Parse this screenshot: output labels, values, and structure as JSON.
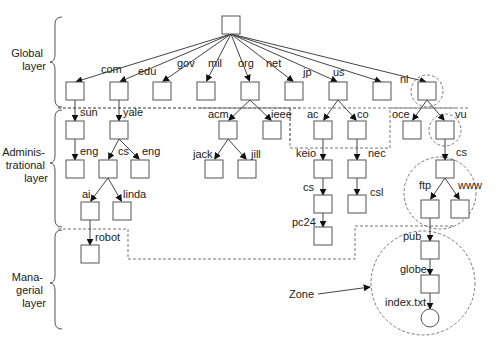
{
  "figure": {
    "type": "DNS name space partitioned into layers",
    "layers": [
      {
        "id": "global",
        "label_lines": [
          "Global",
          "layer"
        ]
      },
      {
        "id": "administrational",
        "label_lines": [
          "Adminis-",
          "trational",
          "layer"
        ]
      },
      {
        "id": "managerial",
        "label_lines": [
          "Mana-",
          "gerial",
          "layer"
        ]
      }
    ],
    "annotation": {
      "label": "Zone"
    },
    "nodes": [
      {
        "id": "root",
        "shape": "box",
        "x": 222,
        "y": 16
      },
      {
        "id": "com",
        "shape": "box",
        "x": 66,
        "y": 82,
        "label": "com",
        "parent": "root",
        "lx": 101,
        "ly": 73
      },
      {
        "id": "edu",
        "shape": "box",
        "x": 110,
        "y": 82,
        "label": "edu",
        "parent": "root",
        "lx": 138,
        "ly": 75
      },
      {
        "id": "gov",
        "shape": "box",
        "x": 153,
        "y": 82,
        "label": "gov",
        "parent": "root",
        "lx": 177,
        "ly": 67
      },
      {
        "id": "mil",
        "shape": "box",
        "x": 197,
        "y": 82,
        "label": "mil",
        "parent": "root",
        "lx": 208,
        "ly": 67
      },
      {
        "id": "org",
        "shape": "box",
        "x": 241,
        "y": 82,
        "label": "org",
        "parent": "root",
        "lx": 238,
        "ly": 67
      },
      {
        "id": "net",
        "shape": "box",
        "x": 285,
        "y": 82,
        "label": "net",
        "parent": "root",
        "lx": 266,
        "ly": 67
      },
      {
        "id": "jp",
        "shape": "box",
        "x": 329,
        "y": 82,
        "label": "jp",
        "parent": "root",
        "lx": 303,
        "ly": 76
      },
      {
        "id": "us",
        "shape": "box",
        "x": 373,
        "y": 82,
        "label": "us",
        "parent": "root",
        "lx": 333,
        "ly": 76
      },
      {
        "id": "nl",
        "shape": "box",
        "x": 418,
        "y": 82,
        "label": "nl",
        "parent": "root",
        "lx": 400,
        "ly": 83
      },
      {
        "id": "sun",
        "shape": "box",
        "x": 66,
        "y": 121,
        "label": "sun",
        "parent": "com",
        "lx": 80,
        "ly": 116
      },
      {
        "id": "yale",
        "shape": "box",
        "x": 110,
        "y": 121,
        "label": "yale",
        "parent": "edu",
        "lx": 123,
        "ly": 116
      },
      {
        "id": "acm",
        "shape": "box",
        "x": 219,
        "y": 121,
        "label": "acm",
        "parent": "org",
        "lx": 208,
        "ly": 118
      },
      {
        "id": "ieee",
        "shape": "box",
        "x": 263,
        "y": 121,
        "label": "ieee",
        "parent": "org",
        "lx": 271,
        "ly": 118
      },
      {
        "id": "ac",
        "shape": "box",
        "x": 314,
        "y": 121,
        "label": "ac",
        "parent": "jp",
        "lx": 307,
        "ly": 118
      },
      {
        "id": "co",
        "shape": "box",
        "x": 348,
        "y": 121,
        "label": "co",
        "parent": "jp",
        "lx": 357,
        "ly": 118
      },
      {
        "id": "oce",
        "shape": "box",
        "x": 403,
        "y": 121,
        "label": "oce",
        "parent": "nl",
        "lx": 392,
        "ly": 118
      },
      {
        "id": "vu",
        "shape": "box",
        "x": 436,
        "y": 121,
        "label": "vu",
        "parent": "nl",
        "lx": 455,
        "ly": 118
      },
      {
        "id": "eng1",
        "shape": "box",
        "x": 66,
        "y": 160,
        "label": "eng",
        "parent": "sun",
        "lx": 80,
        "ly": 155
      },
      {
        "id": "cs1",
        "shape": "box",
        "x": 99,
        "y": 160,
        "label": "cs",
        "parent": "yale",
        "lx": 118,
        "ly": 155
      },
      {
        "id": "eng2",
        "shape": "box",
        "x": 131,
        "y": 160,
        "label": "eng",
        "parent": "yale",
        "lx": 142,
        "ly": 155
      },
      {
        "id": "jack",
        "shape": "box",
        "x": 205,
        "y": 160,
        "label": "jack",
        "parent": "acm",
        "lx": 193,
        "ly": 158
      },
      {
        "id": "jill",
        "shape": "box",
        "x": 238,
        "y": 160,
        "label": "jill",
        "parent": "acm",
        "lx": 251,
        "ly": 158
      },
      {
        "id": "keio",
        "shape": "box",
        "x": 314,
        "y": 160,
        "label": "keio",
        "parent": "ac",
        "lx": 296,
        "ly": 157
      },
      {
        "id": "nec",
        "shape": "box",
        "x": 348,
        "y": 160,
        "label": "nec",
        "parent": "co",
        "lx": 368,
        "ly": 157
      },
      {
        "id": "cs3",
        "shape": "box",
        "x": 436,
        "y": 160,
        "label": "cs",
        "parent": "vu",
        "lx": 456,
        "ly": 156
      },
      {
        "id": "ai",
        "shape": "box",
        "x": 81,
        "y": 202,
        "label": "ai",
        "parent": "cs1",
        "lx": 82,
        "ly": 198
      },
      {
        "id": "linda",
        "shape": "box",
        "x": 113,
        "y": 202,
        "label": "linda",
        "parent": "cs1",
        "lx": 123,
        "ly": 198
      },
      {
        "id": "cs2",
        "shape": "box",
        "x": 314,
        "y": 195,
        "label": "cs",
        "parent": "keio",
        "lx": 303,
        "ly": 191
      },
      {
        "id": "csl",
        "shape": "box",
        "x": 348,
        "y": 195,
        "label": "csl",
        "parent": "nec",
        "lx": 370,
        "ly": 196
      },
      {
        "id": "ftp",
        "shape": "box",
        "x": 421,
        "y": 200,
        "label": "ftp",
        "parent": "cs3",
        "lx": 419,
        "ly": 189
      },
      {
        "id": "www",
        "shape": "box",
        "x": 451,
        "y": 200,
        "label": "www",
        "parent": "cs3",
        "lx": 458,
        "ly": 189
      },
      {
        "id": "robot",
        "shape": "box",
        "x": 81,
        "y": 245,
        "label": "robot",
        "parent": "ai",
        "lx": 95,
        "ly": 241
      },
      {
        "id": "pc24",
        "shape": "box",
        "x": 314,
        "y": 227,
        "label": "pc24",
        "parent": "cs2",
        "lx": 292,
        "ly": 226
      },
      {
        "id": "pub",
        "shape": "box",
        "x": 421,
        "y": 241,
        "label": "pub",
        "parent": "ftp",
        "lx": 403,
        "ly": 240
      },
      {
        "id": "globe",
        "shape": "box",
        "x": 421,
        "y": 275,
        "label": "globe",
        "parent": "pub",
        "lx": 400,
        "ly": 273
      },
      {
        "id": "index",
        "shape": "circle",
        "x": 421,
        "y": 309,
        "label": "index.txt",
        "parent": "globe",
        "lx": 385,
        "ly": 306
      }
    ]
  }
}
